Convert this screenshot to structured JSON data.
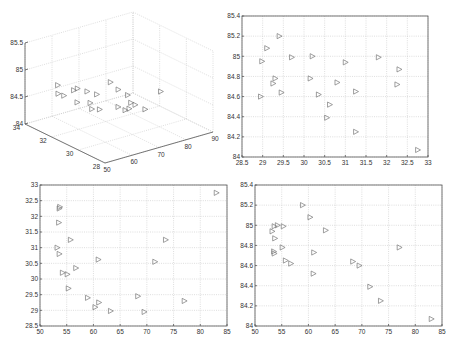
{
  "chart_data": [
    {
      "type": "scatter",
      "subtype": "scatter3d",
      "title": "",
      "xlabel": "",
      "ylabel": "",
      "zlabel": "",
      "xlim": [
        50,
        90
      ],
      "ylim": [
        28,
        34
      ],
      "zlim": [
        84,
        85.5
      ],
      "xticks": [
        "50",
        "60",
        "70",
        "80",
        "90"
      ],
      "yticks": [
        "28",
        "30",
        "32",
        "34"
      ],
      "zticks": [
        "84",
        "84.5",
        "85",
        "85.5"
      ],
      "grid": true,
      "marker": "triangle-right",
      "points": [
        [
          83.0,
          32.75,
          84.07
        ],
        [
          73.5,
          31.25,
          84.25
        ],
        [
          71.5,
          30.55,
          84.39
        ],
        [
          77.0,
          29.3,
          84.78
        ],
        [
          69.5,
          28.95,
          84.6
        ],
        [
          68.3,
          29.45,
          84.64
        ],
        [
          63.2,
          28.98,
          84.95
        ],
        [
          60.9,
          30.62,
          84.52
        ],
        [
          61.0,
          29.25,
          84.73
        ],
        [
          60.3,
          29.1,
          85.08
        ],
        [
          58.9,
          29.4,
          85.2
        ],
        [
          56.7,
          30.35,
          84.62
        ],
        [
          55.7,
          31.25,
          84.65
        ],
        [
          55.3,
          29.7,
          84.99
        ],
        [
          55.1,
          30.15,
          84.78
        ],
        [
          54.2,
          30.2,
          85.0
        ],
        [
          53.7,
          32.3,
          84.87
        ],
        [
          53.6,
          32.25,
          84.72
        ],
        [
          53.5,
          31.8,
          84.74
        ],
        [
          53.6,
          30.8,
          84.99
        ],
        [
          53.2,
          31.0,
          84.94
        ]
      ]
    },
    {
      "type": "scatter",
      "title": "",
      "xlabel": "",
      "ylabel": "",
      "xlim": [
        28.5,
        33
      ],
      "ylim": [
        84,
        85.4
      ],
      "xticks": [
        "28.5",
        "29",
        "29.5",
        "30",
        "30.5",
        "31",
        "31.5",
        "32",
        "32.5",
        "33"
      ],
      "yticks": [
        "84",
        "84.2",
        "84.4",
        "84.6",
        "84.8",
        "85",
        "85.2",
        "85.4"
      ],
      "grid": true,
      "marker": "triangle-right",
      "x": [
        32.75,
        31.25,
        30.55,
        29.3,
        28.95,
        29.45,
        28.98,
        30.62,
        29.25,
        29.1,
        29.4,
        30.35,
        31.25,
        29.7,
        30.15,
        30.2,
        32.3,
        32.25,
        31.8,
        30.8,
        31.0
      ],
      "y": [
        84.07,
        84.25,
        84.39,
        84.78,
        84.6,
        84.64,
        84.95,
        84.52,
        84.73,
        85.08,
        85.2,
        84.62,
        84.65,
        84.99,
        84.78,
        85.0,
        84.87,
        84.72,
        84.99,
        84.74,
        84.94
      ]
    },
    {
      "type": "scatter",
      "title": "",
      "xlabel": "",
      "ylabel": "",
      "xlim": [
        50,
        85
      ],
      "ylim": [
        28.5,
        33
      ],
      "xticks": [
        "50",
        "55",
        "60",
        "65",
        "70",
        "75",
        "80",
        "85"
      ],
      "yticks": [
        "28.5",
        "29",
        "29.5",
        "30",
        "30.5",
        "31",
        "31.5",
        "32",
        "32.5",
        "33"
      ],
      "grid": true,
      "marker": "triangle-right",
      "x": [
        83.0,
        73.5,
        71.5,
        77.0,
        69.5,
        68.3,
        63.2,
        60.9,
        61.0,
        60.3,
        58.9,
        56.7,
        55.7,
        55.3,
        55.1,
        54.2,
        53.7,
        53.6,
        53.5,
        53.6,
        53.2
      ],
      "y": [
        32.75,
        31.25,
        30.55,
        29.3,
        28.95,
        29.45,
        28.98,
        30.62,
        29.25,
        29.1,
        29.4,
        30.35,
        31.25,
        29.7,
        30.15,
        30.2,
        32.3,
        32.25,
        31.8,
        30.8,
        31.0
      ]
    },
    {
      "type": "scatter",
      "title": "",
      "xlabel": "",
      "ylabel": "",
      "xlim": [
        50,
        85
      ],
      "ylim": [
        84,
        85.4
      ],
      "xticks": [
        "50",
        "55",
        "60",
        "65",
        "70",
        "75",
        "80",
        "85"
      ],
      "yticks": [
        "84",
        "84.2",
        "84.4",
        "84.6",
        "84.8",
        "85",
        "85.2",
        "85.4"
      ],
      "grid": true,
      "marker": "triangle-right",
      "x": [
        83.0,
        73.5,
        71.5,
        77.0,
        69.5,
        68.3,
        63.2,
        60.9,
        61.0,
        60.3,
        58.9,
        56.7,
        55.7,
        55.3,
        55.1,
        54.2,
        53.7,
        53.6,
        53.5,
        53.6,
        53.2
      ],
      "y": [
        84.07,
        84.25,
        84.39,
        84.78,
        84.6,
        84.64,
        84.95,
        84.52,
        84.73,
        85.08,
        85.2,
        84.62,
        84.65,
        84.99,
        84.78,
        85.0,
        84.87,
        84.72,
        84.74,
        84.99,
        84.94
      ]
    }
  ]
}
